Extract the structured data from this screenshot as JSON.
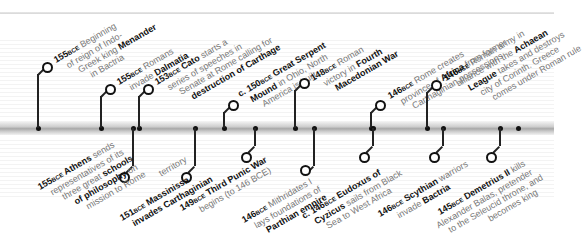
{
  "timeline": {
    "above": [
      {
        "year": "155",
        "era": "BCE",
        "lines": [
          {
            "text": " Beginning",
            "bold": false
          },
          {
            "text": "of reign of Indo-",
            "bold": false
          },
          {
            "text": "Greek king ",
            "bold": false,
            "bold_tail": "Menander"
          },
          {
            "text": "in Bactria",
            "bold": false
          }
        ]
      },
      {
        "year": "155",
        "era": "BCE",
        "lines": [
          {
            "text": " Romans",
            "bold": false
          },
          {
            "text": "invade ",
            "bold": false,
            "bold_tail": "Dalmatia"
          }
        ]
      },
      {
        "year": "153",
        "era": "BCE",
        "lines": [
          {
            "text": " Cato starts a",
            "bold": false
          },
          {
            "text": "series of speeches in",
            "bold": false
          },
          {
            "text": "Senate at Rome calling for",
            "bold": false
          },
          {
            "text": "destruction of Carthage",
            "bold": true
          }
        ]
      },
      {
        "year": "c. 150",
        "era": "BCE",
        "lines": [
          {
            "text": " Great Serpent",
            "bold": true
          },
          {
            "text": "Mound in Ohio, North",
            "bold": false
          },
          {
            "text": "America is built",
            "bold": false
          }
        ]
      },
      {
        "year": "148",
        "era": "BCE",
        "lines": [
          {
            "text": " Roman",
            "bold": false
          },
          {
            "text": "victory in Fourth",
            "bold": false
          },
          {
            "text": "Macedonian War",
            "bold": true
          }
        ]
      },
      {
        "year": "146",
        "era": "BCE",
        "lines": [
          {
            "text": " Rome creates",
            "bold": false
          },
          {
            "text": "province of Africa from former",
            "bold": false
          },
          {
            "text": "Carthaginian possessions",
            "bold": false
          }
        ]
      },
      {
        "year": "146",
        "era": "BCE",
        "lines": [
          {
            "text": " Roman army in",
            "bold": false
          },
          {
            "text": "alliance with the Achaean",
            "bold": false
          },
          {
            "text": "League takes and destroys",
            "bold": false
          },
          {
            "text": "city of Corinth. Greece",
            "bold": false
          },
          {
            "text": "comes under Roman rule",
            "bold": false
          }
        ]
      }
    ],
    "below": [
      {
        "year": "155",
        "era": "BCE",
        "lines": [
          {
            "text": " Athens sends",
            "bold": false
          },
          {
            "text": "representatives of its",
            "bold": false
          },
          {
            "text": "three great schools",
            "bold": false
          },
          {
            "text": "of philosophy on",
            "bold": false
          },
          {
            "text": "mission to Rome",
            "bold": false
          }
        ]
      },
      {
        "year": "151",
        "era": "BCE",
        "lines": [
          {
            "text": " Massinissa",
            "bold": true
          },
          {
            "text": "invades Carthaginian",
            "bold": true
          },
          {
            "text": "territory",
            "bold": false
          }
        ]
      },
      {
        "year": "149",
        "era": "BCE",
        "lines": [
          {
            "text": " Third Punic War",
            "bold": true
          },
          {
            "text": "begins (to 146 BCE)",
            "bold": false
          }
        ]
      },
      {
        "year": "146",
        "era": "BCE",
        "lines": [
          {
            "text": " Mithridates I",
            "bold": false
          },
          {
            "text": "lays foundations of",
            "bold": false
          },
          {
            "text": "Parthian empire",
            "bold": true
          }
        ]
      },
      {
        "year": "c. 146",
        "era": "BCE",
        "lines": [
          {
            "text": " Eudoxus of",
            "bold": true
          },
          {
            "text": "Cyzicus sails from Black",
            "bold": false
          },
          {
            "text": "Sea to West Africa",
            "bold": false
          }
        ]
      },
      {
        "year": "146",
        "era": "BCE",
        "lines": [
          {
            "text": " Scythian warriors",
            "bold": false
          },
          {
            "text": "invade Bactria",
            "bold": false
          }
        ]
      },
      {
        "year": "145",
        "era": "BCE",
        "lines": [
          {
            "text": " Demetrius II kills",
            "bold": false
          },
          {
            "text": "Alexander Balas, pretender",
            "bold": false
          },
          {
            "text": "to the Seleucid throne, and",
            "bold": false
          },
          {
            "text": "becomes king",
            "bold": false
          }
        ]
      }
    ]
  },
  "text": {
    "a0": [
      "155",
      "BCE",
      " Beginning",
      "of reign of Indo-",
      "Greek king ",
      "Menander",
      "in Bactria"
    ],
    "a1": [
      "155",
      "BCE",
      " Romans",
      "invade ",
      "Dalmatia"
    ],
    "a2": [
      "153",
      "BCE",
      " Cato",
      " starts a",
      "series of speeches in",
      "Senate at Rome calling for",
      "destruction of Carthage"
    ],
    "a3": [
      "c. 150",
      "BCE",
      " Great Serpent",
      "Mound",
      " in Ohio, North",
      "America is built"
    ],
    "a4": [
      "148",
      "BCE",
      " Roman",
      "victory in ",
      "Fourth",
      "Macedonian War"
    ],
    "a5": [
      "146",
      "BCE",
      " Rome creates",
      "province of ",
      "Africa",
      " from former",
      "Carthaginian possessions"
    ],
    "a6": [
      "146",
      "BCE",
      " Roman army in",
      "alliance with the ",
      "Achaean",
      "League",
      " takes and destroys",
      "city of Corinth. Greece",
      "comes under Roman rule"
    ],
    "b0": [
      "155",
      "BCE",
      " Athens",
      " sends",
      "representatives of its",
      "three great ",
      "schools",
      "of philosophy",
      " on",
      "mission to Rome"
    ],
    "b1": [
      "151",
      "BCE",
      " Massinissa",
      "invades Carthaginian",
      "territory"
    ],
    "b2": [
      "149",
      "BCE",
      " Third Punic War",
      "begins (to 146 BCE)"
    ],
    "b3": [
      "146",
      "BCE",
      " Mithridates I",
      "lays foundations of",
      "Parthian empire"
    ],
    "b4": [
      "c. 146",
      "BCE",
      " Eudoxus of",
      "Cyzicus",
      " sails from Black",
      "Sea to West Africa"
    ],
    "b5": [
      "146",
      "BCE",
      " Scythian",
      " warriors",
      "invade ",
      "Bactria"
    ],
    "b6": [
      "145",
      "BCE",
      " Demetrius II",
      " kills",
      "Alexander Balas, pretender",
      "to the Seleucid throne, and",
      "becomes king"
    ]
  }
}
